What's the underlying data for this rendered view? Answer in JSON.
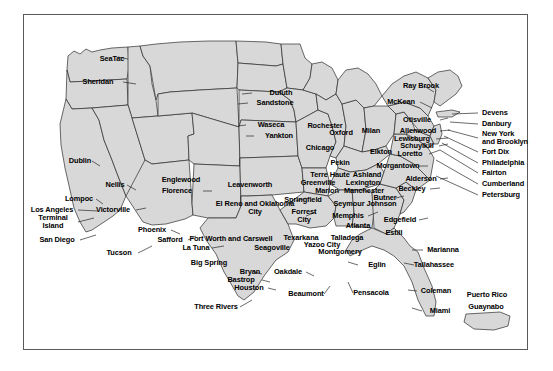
{
  "figure": {
    "kind": "map",
    "title": "",
    "region": "United States with Puerto Rico inset",
    "frame_color": "#5a5a5a",
    "land_fill": "#d8d8d8",
    "border_color": "#2b2b2b",
    "background": "#ffffff",
    "label_color": "#000000"
  },
  "labels": [
    {
      "name": "seatac",
      "text": "SeaTac",
      "x": 112,
      "y": 59,
      "anchor": "c"
    },
    {
      "name": "sheridan",
      "text": "Sheridan",
      "x": 98,
      "y": 82,
      "anchor": "c"
    },
    {
      "name": "dublin",
      "text": "Dublin",
      "x": 80,
      "y": 161,
      "anchor": "c"
    },
    {
      "name": "nellis",
      "text": "Nellis",
      "x": 115,
      "y": 185,
      "anchor": "c"
    },
    {
      "name": "lompoc",
      "text": "Lompoc",
      "x": 79,
      "y": 199,
      "anchor": "c"
    },
    {
      "name": "los-angeles",
      "text": "Los Angeles",
      "x": 52,
      "y": 210,
      "anchor": "c"
    },
    {
      "name": "terminal-island",
      "text": "Terminal\nIsland",
      "x": 53,
      "y": 222,
      "anchor": "mc"
    },
    {
      "name": "san-diego",
      "text": "San Diego",
      "x": 57,
      "y": 240,
      "anchor": "c"
    },
    {
      "name": "victorville",
      "text": "Victorville",
      "x": 113,
      "y": 210,
      "anchor": "c"
    },
    {
      "name": "phoenix",
      "text": "Phoenix",
      "x": 152,
      "y": 230,
      "anchor": "c"
    },
    {
      "name": "safford",
      "text": "Safford",
      "x": 170,
      "y": 240,
      "anchor": "c"
    },
    {
      "name": "tucson",
      "text": "Tucson",
      "x": 119,
      "y": 253,
      "anchor": "c"
    },
    {
      "name": "englewood",
      "text": "Englewood",
      "x": 181,
      "y": 180,
      "anchor": "c"
    },
    {
      "name": "florence",
      "text": "Florence",
      "x": 177,
      "y": 191,
      "anchor": "c"
    },
    {
      "name": "leavenworth",
      "text": "Leavenworth",
      "x": 250,
      "y": 185,
      "anchor": "c"
    },
    {
      "name": "el-reno-oklahoma-city",
      "text": "El Reno and Oklahoma\nCity",
      "x": 255,
      "y": 208,
      "anchor": "mc"
    },
    {
      "name": "la-tuna",
      "text": "La Tuna",
      "x": 196,
      "y": 248,
      "anchor": "c"
    },
    {
      "name": "fort-worth-carswell",
      "text": "Fort Worth and Carswell",
      "x": 231,
      "y": 239,
      "anchor": "c"
    },
    {
      "name": "seagoville",
      "text": "Seagoville",
      "x": 272,
      "y": 248,
      "anchor": "c"
    },
    {
      "name": "big-spring",
      "text": "Big Spring",
      "x": 209,
      "y": 263,
      "anchor": "c"
    },
    {
      "name": "bryan",
      "text": "Bryan",
      "x": 250,
      "y": 272,
      "anchor": "c"
    },
    {
      "name": "bastrop",
      "text": "Bastrop",
      "x": 241,
      "y": 280,
      "anchor": "c"
    },
    {
      "name": "houston",
      "text": "Houston",
      "x": 249,
      "y": 288,
      "anchor": "c"
    },
    {
      "name": "oakdale",
      "text": "Oakdale",
      "x": 288,
      "y": 272,
      "anchor": "c"
    },
    {
      "name": "beaumont",
      "text": "Beaumont",
      "x": 306,
      "y": 294,
      "anchor": "c"
    },
    {
      "name": "three-rivers",
      "text": "Three Rivers",
      "x": 216,
      "y": 307,
      "anchor": "c"
    },
    {
      "name": "duluth",
      "text": "Duluth",
      "x": 281,
      "y": 93,
      "anchor": "c"
    },
    {
      "name": "sandstone",
      "text": "Sandstone",
      "x": 275,
      "y": 103,
      "anchor": "c"
    },
    {
      "name": "waseca",
      "text": "Waseca",
      "x": 271,
      "y": 125,
      "anchor": "c"
    },
    {
      "name": "yankton",
      "text": "Yankton",
      "x": 279,
      "y": 136,
      "anchor": "c"
    },
    {
      "name": "rochester",
      "text": "Rochester",
      "x": 325,
      "y": 126,
      "anchor": "c"
    },
    {
      "name": "oxford",
      "text": "Oxford",
      "x": 341,
      "y": 133,
      "anchor": "c"
    },
    {
      "name": "milan",
      "text": "Milan",
      "x": 371,
      "y": 131,
      "anchor": "c"
    },
    {
      "name": "chicago",
      "text": "Chicago",
      "x": 320,
      "y": 148,
      "anchor": "c"
    },
    {
      "name": "pekin",
      "text": "Pekin",
      "x": 340,
      "y": 163,
      "anchor": "c"
    },
    {
      "name": "terre-haute",
      "text": "Terre Haute",
      "x": 330,
      "y": 175,
      "anchor": "c"
    },
    {
      "name": "greenville",
      "text": "Greenville",
      "x": 318,
      "y": 183,
      "anchor": "c"
    },
    {
      "name": "marion",
      "text": "Marion",
      "x": 327,
      "y": 191,
      "anchor": "c"
    },
    {
      "name": "springfield",
      "text": "Springfield",
      "x": 303,
      "y": 200,
      "anchor": "c"
    },
    {
      "name": "forrest-city",
      "text": "Forrest\nCity",
      "x": 304,
      "y": 216,
      "anchor": "mc"
    },
    {
      "name": "memphis",
      "text": "Memphis",
      "x": 348,
      "y": 216,
      "anchor": "c"
    },
    {
      "name": "texarkana",
      "text": "Texarkana",
      "x": 301,
      "y": 238,
      "anchor": "c"
    },
    {
      "name": "yazoo-city",
      "text": "Yazoo City",
      "x": 322,
      "y": 245,
      "anchor": "c"
    },
    {
      "name": "talladega",
      "text": "Talladega",
      "x": 347,
      "y": 238,
      "anchor": "c"
    },
    {
      "name": "montgomery",
      "text": "Montgomery",
      "x": 340,
      "y": 252,
      "anchor": "c"
    },
    {
      "name": "atlanta",
      "text": "Atlanta",
      "x": 358,
      "y": 226,
      "anchor": "c"
    },
    {
      "name": "elkton",
      "text": "Elkton",
      "x": 381,
      "y": 152,
      "anchor": "c"
    },
    {
      "name": "ashland",
      "text": "Ashland",
      "x": 367,
      "y": 175,
      "anchor": "c"
    },
    {
      "name": "lexington",
      "text": "Lexington",
      "x": 363,
      "y": 183,
      "anchor": "c"
    },
    {
      "name": "manchester",
      "text": "Manchester",
      "x": 364,
      "y": 191,
      "anchor": "c"
    },
    {
      "name": "seymour-johnson",
      "text": "Seymour Johnson",
      "x": 365,
      "y": 204,
      "anchor": "c"
    },
    {
      "name": "butner",
      "text": "Butner",
      "x": 385,
      "y": 198,
      "anchor": "c"
    },
    {
      "name": "morgantown",
      "text": "Morgantown",
      "x": 398,
      "y": 166,
      "anchor": "c"
    },
    {
      "name": "alderson",
      "text": "Alderson",
      "x": 421,
      "y": 179,
      "anchor": "c"
    },
    {
      "name": "beckley",
      "text": "Beckley",
      "x": 412,
      "y": 189,
      "anchor": "c"
    },
    {
      "name": "edgefield",
      "text": "Edgefield",
      "x": 400,
      "y": 220,
      "anchor": "c"
    },
    {
      "name": "estill",
      "text": "Estill",
      "x": 394,
      "y": 233,
      "anchor": "c"
    },
    {
      "name": "eglin",
      "text": "Eglin",
      "x": 377,
      "y": 265,
      "anchor": "c"
    },
    {
      "name": "pensacola",
      "text": "Pensacola",
      "x": 371,
      "y": 293,
      "anchor": "c"
    },
    {
      "name": "marianna",
      "text": "Marianna",
      "x": 443,
      "y": 250,
      "anchor": "c"
    },
    {
      "name": "tallahassee",
      "text": "Tallahassee",
      "x": 434,
      "y": 265,
      "anchor": "c"
    },
    {
      "name": "coleman",
      "text": "Coleman",
      "x": 436,
      "y": 291,
      "anchor": "c"
    },
    {
      "name": "miami",
      "text": "Miami",
      "x": 440,
      "y": 311,
      "anchor": "c"
    },
    {
      "name": "puerto-rico",
      "text": "Puerto Rico",
      "x": 487,
      "y": 295,
      "anchor": "c"
    },
    {
      "name": "guaynabo",
      "text": "Guaynabo",
      "x": 486,
      "y": 307,
      "anchor": "c"
    },
    {
      "name": "lewisburg",
      "text": "Lewisburg",
      "x": 412,
      "y": 139,
      "anchor": "c"
    },
    {
      "name": "schuylkill",
      "text": "Schuylkill",
      "x": 417,
      "y": 146,
      "anchor": "c"
    },
    {
      "name": "loretto",
      "text": "Loretto",
      "x": 410,
      "y": 154,
      "anchor": "c"
    },
    {
      "name": "allenwood",
      "text": "Allenwood",
      "x": 418,
      "y": 131,
      "anchor": "c"
    },
    {
      "name": "otisville",
      "text": "Otisville",
      "x": 417,
      "y": 120,
      "anchor": "c"
    },
    {
      "name": "mckean",
      "text": "McKean",
      "x": 401,
      "y": 102,
      "anchor": "c"
    },
    {
      "name": "ray-brook",
      "text": "Ray Brook",
      "x": 421,
      "y": 86,
      "anchor": "c"
    },
    {
      "name": "devens",
      "text": "Devens",
      "x": 482,
      "y": 113,
      "anchor": "l-list"
    },
    {
      "name": "danbury",
      "text": "Danbury",
      "x": 482,
      "y": 124,
      "anchor": "l-list"
    },
    {
      "name": "new-york-brooklyn",
      "text": "New York\nand Brooklyn",
      "x": 482,
      "y": 138,
      "anchor": "l-list"
    },
    {
      "name": "fort-dix",
      "text": "Fort Dix",
      "x": 482,
      "y": 152,
      "anchor": "l-list"
    },
    {
      "name": "philadelphia",
      "text": "Philadelphia",
      "x": 482,
      "y": 163,
      "anchor": "l-list"
    },
    {
      "name": "fairton",
      "text": "Fairton",
      "x": 482,
      "y": 173,
      "anchor": "l-list"
    },
    {
      "name": "cumberland",
      "text": "Cumberland",
      "x": 482,
      "y": 184,
      "anchor": "l-list"
    },
    {
      "name": "petersburg",
      "text": "Petersburg",
      "x": 482,
      "y": 195,
      "anchor": "l-list"
    }
  ]
}
